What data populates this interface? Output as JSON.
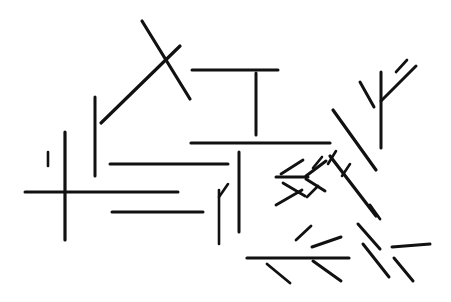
{
  "canvas": {
    "width": 451,
    "height": 302,
    "background_color": "#ffffff",
    "stroke_color": "#111111",
    "title": "Line Segment Arrangement"
  },
  "figure": {
    "segment_count": 40,
    "default_stroke_width": 3
  },
  "segments": [
    {
      "name": "long-diagonal-roof-right",
      "x1": 142,
      "y1": 21,
      "x2": 190,
      "y2": 99,
      "width": 3.2
    },
    {
      "name": "diagonal-roof-left",
      "x1": 180,
      "y1": 46,
      "x2": 101,
      "y2": 123,
      "width": 3.2
    },
    {
      "name": "vertical-left-upper",
      "x1": 95,
      "y1": 97,
      "x2": 95,
      "y2": 176,
      "width": 3
    },
    {
      "name": "vertical-left-short",
      "x1": 65,
      "y1": 132,
      "x2": 65,
      "y2": 240,
      "width": 3.2
    },
    {
      "name": "horizontal-cross-bar",
      "x1": 25,
      "y1": 192,
      "x2": 178,
      "y2": 192,
      "width": 3
    },
    {
      "name": "horizontal-top-right",
      "x1": 192,
      "y1": 70,
      "x2": 278,
      "y2": 70,
      "width": 3
    },
    {
      "name": "vertical-tee-stem",
      "x1": 256,
      "y1": 73,
      "x2": 256,
      "y2": 135,
      "width": 3
    },
    {
      "name": "horizontal-mid-long",
      "x1": 191,
      "y1": 143,
      "x2": 330,
      "y2": 143,
      "width": 3.2
    },
    {
      "name": "horizontal-mid-short",
      "x1": 110,
      "y1": 164,
      "x2": 228,
      "y2": 164,
      "width": 3
    },
    {
      "name": "horizontal-lower-left",
      "x1": 112,
      "y1": 212,
      "x2": 203,
      "y2": 212,
      "width": 3
    },
    {
      "name": "vertical-center-long",
      "x1": 239,
      "y1": 152,
      "x2": 239,
      "y2": 232,
      "width": 3
    },
    {
      "name": "vertical-center-short",
      "x1": 219,
      "y1": 190,
      "x2": 219,
      "y2": 244,
      "width": 2.6
    },
    {
      "name": "tick-diagonal-center",
      "x1": 219,
      "y1": 197,
      "x2": 228,
      "y2": 184,
      "width": 2.6
    },
    {
      "name": "vertical-right-tall",
      "x1": 381,
      "y1": 72,
      "x2": 381,
      "y2": 148,
      "width": 3
    },
    {
      "name": "diagonal-y-right-arm",
      "x1": 381,
      "y1": 101,
      "x2": 416,
      "y2": 66,
      "width": 3
    },
    {
      "name": "diagonal-y-left-arm",
      "x1": 360,
      "y1": 82,
      "x2": 374,
      "y2": 107,
      "width": 3
    },
    {
      "name": "long-diagonal-upper-right",
      "x1": 333,
      "y1": 110,
      "x2": 376,
      "y2": 170,
      "width": 3.2
    },
    {
      "name": "long-diagonal-lower-right",
      "x1": 330,
      "y1": 156,
      "x2": 376,
      "y2": 216,
      "width": 3.2
    },
    {
      "name": "horizontal-arrow-shaft-upper",
      "x1": 276,
      "y1": 177,
      "x2": 308,
      "y2": 177,
      "width": 3
    },
    {
      "name": "arrow-upper-head-top",
      "x1": 306,
      "y1": 176,
      "x2": 326,
      "y2": 161,
      "width": 3
    },
    {
      "name": "arrow-upper-head-bottom",
      "x1": 306,
      "y1": 179,
      "x2": 325,
      "y2": 191,
      "width": 3
    },
    {
      "name": "diagonal-cluster-a",
      "x1": 281,
      "y1": 174,
      "x2": 303,
      "y2": 160,
      "width": 2.8
    },
    {
      "name": "diagonal-cluster-b",
      "x1": 283,
      "y1": 183,
      "x2": 305,
      "y2": 196,
      "width": 2.8
    },
    {
      "name": "diagonal-cluster-c",
      "x1": 276,
      "y1": 205,
      "x2": 302,
      "y2": 190,
      "width": 2.8
    },
    {
      "name": "diagonal-cluster-d",
      "x1": 313,
      "y1": 168,
      "x2": 322,
      "y2": 157,
      "width": 2.6
    },
    {
      "name": "diagonal-cluster-e",
      "x1": 328,
      "y1": 164,
      "x2": 336,
      "y2": 151,
      "width": 2.6
    },
    {
      "name": "diagonal-cluster-f",
      "x1": 342,
      "y1": 176,
      "x2": 350,
      "y2": 164,
      "width": 2.6
    },
    {
      "name": "diagonal-cluster-g",
      "x1": 307,
      "y1": 197,
      "x2": 318,
      "y2": 186,
      "width": 2.6
    },
    {
      "name": "horizontal-arrow-shaft-lower",
      "x1": 247,
      "y1": 258,
      "x2": 349,
      "y2": 258,
      "width": 3.2
    },
    {
      "name": "arrow-lower-head-top",
      "x1": 312,
      "y1": 247,
      "x2": 341,
      "y2": 237,
      "width": 3
    },
    {
      "name": "arrow-lower-head-bottom",
      "x1": 313,
      "y1": 261,
      "x2": 341,
      "y2": 281,
      "width": 3
    },
    {
      "name": "diagonal-bottom-left-tick",
      "x1": 267,
      "y1": 264,
      "x2": 290,
      "y2": 283,
      "width": 2.8
    },
    {
      "name": "diagonal-bottom-mid",
      "x1": 296,
      "y1": 240,
      "x2": 311,
      "y2": 226,
      "width": 2.8
    },
    {
      "name": "diagonal-right-fan-a",
      "x1": 358,
      "y1": 224,
      "x2": 380,
      "y2": 249,
      "width": 3
    },
    {
      "name": "diagonal-right-fan-b",
      "x1": 363,
      "y1": 244,
      "x2": 389,
      "y2": 277,
      "width": 3
    },
    {
      "name": "diagonal-right-fan-c",
      "x1": 370,
      "y1": 205,
      "x2": 380,
      "y2": 219,
      "width": 2.8
    },
    {
      "name": "horizontal-right-small",
      "x1": 392,
      "y1": 247,
      "x2": 430,
      "y2": 244,
      "width": 3
    },
    {
      "name": "diagonal-right-lower",
      "x1": 394,
      "y1": 258,
      "x2": 413,
      "y2": 281,
      "width": 3
    },
    {
      "name": "diagonal-far-right-top",
      "x1": 396,
      "y1": 72,
      "x2": 407,
      "y2": 60,
      "width": 2.6
    },
    {
      "name": "vertical-far-left-tick",
      "x1": 48,
      "y1": 152,
      "x2": 48,
      "y2": 166,
      "width": 2.6
    }
  ]
}
